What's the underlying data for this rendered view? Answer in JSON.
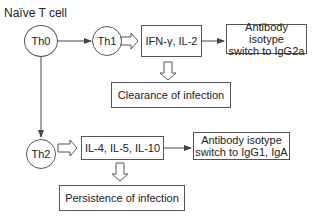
{
  "diagram": {
    "title": "Naïve T cell",
    "nodes": {
      "th0": "Th0",
      "th1": "Th1",
      "th2": "Th2",
      "th1_cytokines": "IFN-γ,  IL-2",
      "th1_antibody_line1": "Antibody isotype",
      "th1_antibody_line2": "switch to IgG2a",
      "th1_outcome": "Clearance of infection",
      "th2_cytokines": "IL-4,  IL-5, IL-10",
      "th2_antibody_line1": "Antibody isotype",
      "th2_antibody_line2": "switch to IgG1, IgA",
      "th2_outcome": "Persistence of infection"
    },
    "edges": [
      {
        "from": "Th0",
        "to": "Th1",
        "style": "line-arrow"
      },
      {
        "from": "Th0",
        "to": "Th2",
        "style": "line-arrow"
      },
      {
        "from": "Th1",
        "to": "IFN-γ, IL-2",
        "style": "hollow-arrow"
      },
      {
        "from": "IFN-γ, IL-2",
        "to": "Antibody isotype switch to IgG2a",
        "style": "line-arrow"
      },
      {
        "from": "IFN-γ, IL-2",
        "to": "Clearance of infection",
        "style": "hollow-arrow"
      },
      {
        "from": "Th2",
        "to": "IL-4, IL-5, IL-10",
        "style": "hollow-arrow"
      },
      {
        "from": "IL-4, IL-5, IL-10",
        "to": "Antibody isotype switch to IgG1, IgA",
        "style": "line-arrow"
      },
      {
        "from": "IL-4, IL-5, IL-10",
        "to": "Persistence of infection",
        "style": "hollow-arrow"
      }
    ],
    "colors": {
      "stroke": "#555555",
      "text": "#222222",
      "background": "#ffffff"
    }
  }
}
